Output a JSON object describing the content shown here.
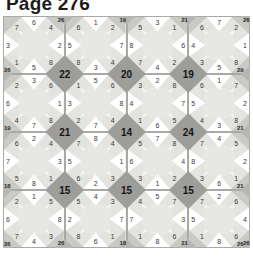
{
  "page": {
    "title": "Page 276",
    "background_color": "#ffffff"
  },
  "puzzle": {
    "type": "numbered-octagon-grid",
    "rows": 4,
    "cols": 4,
    "block_color": "#e3e3e0",
    "node_color": "#9d9d9a",
    "accent_color": "#c9c9c6",
    "blocks": [
      {
        "id": "r1c1",
        "n": "6",
        "e": "2",
        "s": "5",
        "w": "3",
        "nw": "7",
        "ne": "4",
        "sw": "1",
        "se": "8"
      },
      {
        "id": "r1c2",
        "n": "1",
        "e": "7",
        "s": "3",
        "w": "5",
        "nw": "6",
        "ne": "2",
        "sw": "8",
        "se": "4"
      },
      {
        "id": "r1c3",
        "n": "3",
        "e": "6",
        "s": "4",
        "w": "8",
        "nw": "5",
        "ne": "1",
        "sw": "7",
        "se": "2"
      },
      {
        "id": "r1c4",
        "n": "7",
        "e": "1",
        "s": "5",
        "w": "4",
        "nw": "6",
        "ne": "2",
        "sw": "3",
        "se": "8"
      },
      {
        "id": "r2c1",
        "n": "3",
        "e": "1",
        "s": "7",
        "w": "6",
        "nw": "2",
        "ne": "6",
        "sw": "4",
        "se": "8"
      },
      {
        "id": "r2c2",
        "n": "5",
        "e": "8",
        "s": "7",
        "w": "3",
        "nw": "1",
        "ne": "6",
        "sw": "2",
        "se": "4"
      },
      {
        "id": "r2c3",
        "n": "2",
        "e": "7",
        "s": "6",
        "w": "4",
        "nw": "3",
        "ne": "8",
        "sw": "1",
        "se": "5"
      },
      {
        "id": "r2c4",
        "n": "1",
        "e": "2",
        "s": "3",
        "w": "5",
        "nw": "6",
        "ne": "7",
        "sw": "4",
        "se": "8"
      },
      {
        "id": "r3c1",
        "n": "2",
        "e": "3",
        "s": "8",
        "w": "7",
        "nw": "6",
        "ne": "4",
        "sw": "5",
        "se": "1"
      },
      {
        "id": "r3c2",
        "n": "8",
        "e": "1",
        "s": "2",
        "w": "5",
        "nw": "7",
        "ne": "4",
        "sw": "6",
        "se": "3"
      },
      {
        "id": "r3c3",
        "n": "7",
        "e": "4",
        "s": "1",
        "w": "6",
        "nw": "5",
        "ne": "8",
        "sw": "3",
        "se": "2"
      },
      {
        "id": "r3c4",
        "n": "4",
        "e": "2",
        "s": "6",
        "w": "8",
        "nw": "7",
        "ne": "5",
        "sw": "3",
        "se": "1"
      },
      {
        "id": "r4c1",
        "n": "1",
        "e": "8",
        "s": "4",
        "w": "6",
        "nw": "2",
        "ne": "5",
        "sw": "7",
        "se": "3"
      },
      {
        "id": "r4c2",
        "n": "4",
        "e": "7",
        "s": "6",
        "w": "2",
        "nw": "5",
        "ne": "3",
        "sw": "8",
        "se": "1"
      },
      {
        "id": "r4c3",
        "n": "5",
        "e": "3",
        "s": "8",
        "w": "7",
        "nw": "4",
        "ne": "7",
        "sw": "1",
        "se": "6"
      },
      {
        "id": "r4c4",
        "n": "2",
        "e": "4",
        "s": "8",
        "w": "5",
        "nw": "7",
        "ne": "6",
        "sw": "1",
        "se": "6"
      }
    ],
    "nodes": [
      {
        "id": "node-1-1",
        "value": "22",
        "row": 1,
        "col": 1
      },
      {
        "id": "node-1-2",
        "value": "20",
        "row": 1,
        "col": 2
      },
      {
        "id": "node-1-3",
        "value": "19",
        "row": 1,
        "col": 3
      },
      {
        "id": "node-2-1",
        "value": "21",
        "row": 2,
        "col": 1
      },
      {
        "id": "node-2-2",
        "value": "14",
        "row": 2,
        "col": 2
      },
      {
        "id": "node-2-3",
        "value": "24",
        "row": 2,
        "col": 3
      },
      {
        "id": "node-3-1",
        "value": "15",
        "row": 3,
        "col": 1
      },
      {
        "id": "node-3-2",
        "value": "15",
        "row": 3,
        "col": 2
      },
      {
        "id": "node-3-3",
        "value": "15",
        "row": 3,
        "col": 3
      }
    ],
    "edge_markers": {
      "top": [
        "26",
        "19",
        "21",
        "26"
      ],
      "right": [
        "29",
        "21",
        "21",
        "26"
      ],
      "bottom": [
        "26",
        "18",
        "21",
        "26"
      ],
      "left": [
        "26",
        "19",
        "18",
        "26"
      ]
    }
  }
}
